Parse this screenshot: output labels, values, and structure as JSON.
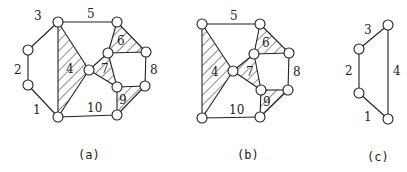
{
  "figure": {
    "panels": [
      {
        "id": "a",
        "caption": "(a)",
        "labels": {
          "l1": "1",
          "l2": "2",
          "l3": "3",
          "l4": "4",
          "l5": "5",
          "l6": "6",
          "l7": "7",
          "l8": "8",
          "l9": "9",
          "l10": "10"
        }
      },
      {
        "id": "b",
        "caption": "(b)",
        "labels": {
          "l4": "4",
          "l5": "5",
          "l6": "6",
          "l7": "7",
          "l8": "8",
          "l9": "9",
          "l10": "10"
        }
      },
      {
        "id": "c",
        "caption": "(c)",
        "labels": {
          "l1": "1",
          "l2": "2",
          "l3": "3",
          "l4": "4"
        }
      }
    ],
    "shaded_faces": {
      "a": [
        "4",
        "6",
        "7",
        "9"
      ],
      "b": [
        "4",
        "6",
        "7",
        "9"
      ]
    },
    "colors": {
      "line": "#222222",
      "background": "#ffffff"
    }
  }
}
